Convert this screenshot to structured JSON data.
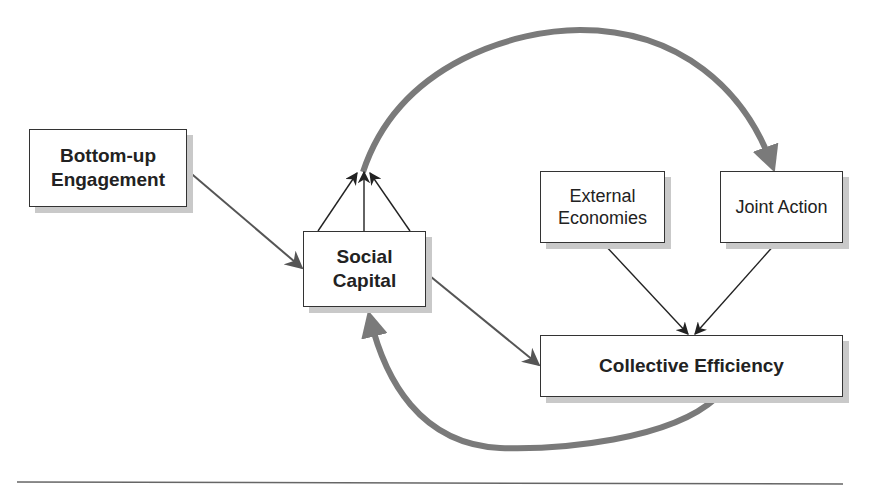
{
  "diagram": {
    "nodes": {
      "bottom_up": {
        "line1": "Bottom-up",
        "line2": "Engagement"
      },
      "social_capital": {
        "line1": "Social",
        "line2": "Capital"
      },
      "external_economies": {
        "line1": "External",
        "line2": "Economies"
      },
      "joint_action": {
        "label": "Joint Action"
      },
      "collective_efficiency": {
        "label": "Collective Efficiency"
      }
    },
    "edges": [
      {
        "from": "Bottom-up Engagement",
        "to": "Social Capital",
        "style": "thin-gray"
      },
      {
        "from": "Social Capital",
        "to": "Collective Efficiency",
        "style": "thin-gray"
      },
      {
        "from": "External Economies",
        "to": "Collective Efficiency",
        "style": "thin-black"
      },
      {
        "from": "Joint Action",
        "to": "Collective Efficiency",
        "style": "thin-black"
      },
      {
        "from": "Social Capital",
        "to": "Joint Action",
        "style": "thick-arc-top"
      },
      {
        "from": "Collective Efficiency",
        "to": "Social Capital",
        "style": "thick-arc-bottom"
      },
      {
        "from": "Social Capital",
        "to": "arc-origin",
        "style": "three-thin-arrows"
      }
    ],
    "colors": {
      "arc": "#7a7a7a",
      "thin_gray": "#555555",
      "thin_black": "#222222",
      "shadow": "#c9c9c9"
    }
  }
}
